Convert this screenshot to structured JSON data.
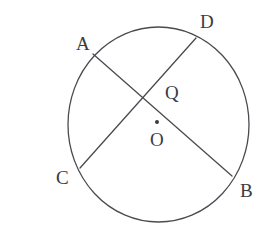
{
  "figure": {
    "kind": "circle-geometry-diagram",
    "background_color": "#ffffff",
    "stroke_color": "#4a4a50",
    "label_color": "#3b3b3f",
    "stroke_width": 1.3
  },
  "circle": {
    "name": "circle-O",
    "center_x": 158.5,
    "center_y": 124.5,
    "radius_x": 90.5,
    "radius_y": 97.5
  },
  "center_marker": {
    "name": "center-dot",
    "x": 157,
    "y": 122,
    "radius": 2.0
  },
  "points": [
    {
      "id": "A",
      "label": "A",
      "x": 93,
      "y": 54,
      "on_circle": true
    },
    {
      "id": "D",
      "label": "D",
      "x": 196,
      "y": 38,
      "on_circle": true
    },
    {
      "id": "Q",
      "label": "Q",
      "x": 141,
      "y": 96,
      "on_circle": false
    },
    {
      "id": "O",
      "label": "O",
      "x": 157,
      "y": 122,
      "on_circle": false
    },
    {
      "id": "C",
      "label": "C",
      "x": 80,
      "y": 168,
      "on_circle": true
    },
    {
      "id": "B",
      "label": "B",
      "x": 232,
      "y": 176,
      "on_circle": true
    }
  ],
  "chords": [
    {
      "id": "AB",
      "name": "chord-ab",
      "from": "A",
      "to": "B",
      "x1": 93,
      "y1": 54,
      "x2": 232,
      "y2": 176
    },
    {
      "id": "CD",
      "name": "chord-cd",
      "from": "C",
      "to": "D",
      "x1": 80,
      "y1": 168,
      "x2": 196,
      "y2": 38
    }
  ],
  "labels": {
    "A": "A",
    "B": "B",
    "C": "C",
    "D": "D",
    "O": "O",
    "Q": "Q"
  }
}
